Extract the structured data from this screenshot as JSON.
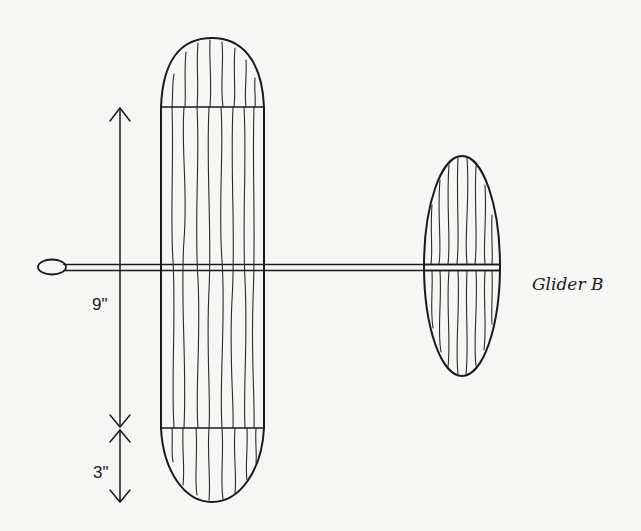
{
  "diagram": {
    "title": "Glider B",
    "dimensions": {
      "span_center": "9\"",
      "span_tip": "3\""
    },
    "parts": {
      "nose_weight": "nose-loop",
      "fuselage": "fuselage-stick",
      "main_wing": "main-wing",
      "tail": "elliptical-stabilizer"
    },
    "colors": {
      "ink": "#1a1a1a",
      "paper": "#f6f6f4"
    }
  }
}
